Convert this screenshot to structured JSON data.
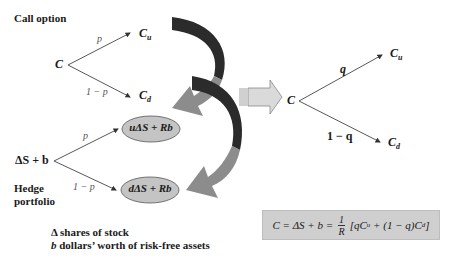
{
  "call_option": {
    "title": "Call option",
    "root": "C",
    "up_node": "C",
    "up_sub": "u",
    "down_node": "C",
    "down_sub": "d",
    "up_prob": "p",
    "down_prob": "1 − p"
  },
  "hedge_portfolio": {
    "title_line1": "Hedge",
    "title_line2": "portfolio",
    "root": "ΔS + b",
    "up_node": "uΔS + Rb",
    "down_node": "dΔS + Rb",
    "up_prob": "p",
    "down_prob": "1 − p"
  },
  "risk_neutral": {
    "root": "C",
    "up_node": "C",
    "up_sub": "u",
    "down_node": "C",
    "down_sub": "d",
    "up_prob": "q",
    "down_prob": "1 − q"
  },
  "legend": {
    "line1_symbol": "Δ",
    "line1_text": " shares of stock",
    "line2_symbol": "b",
    "line2_text": " dollars’ worth of risk-free assets"
  },
  "formula": {
    "left": "C = ΔS + b = ",
    "numerator": "1",
    "denominator": "R",
    "right": " [qC",
    "sub_u": "u",
    "middle": " + (1 − q)C",
    "sub_d": "d",
    "end": "]"
  },
  "colors": {
    "dark_arrow": "#2b2b2b",
    "light_arrow": "#8c8c8c",
    "ellipse_fill": "#c4c4c4",
    "block_arrow_fill": "#dadada",
    "formula_bg": "#cfcfcf"
  }
}
